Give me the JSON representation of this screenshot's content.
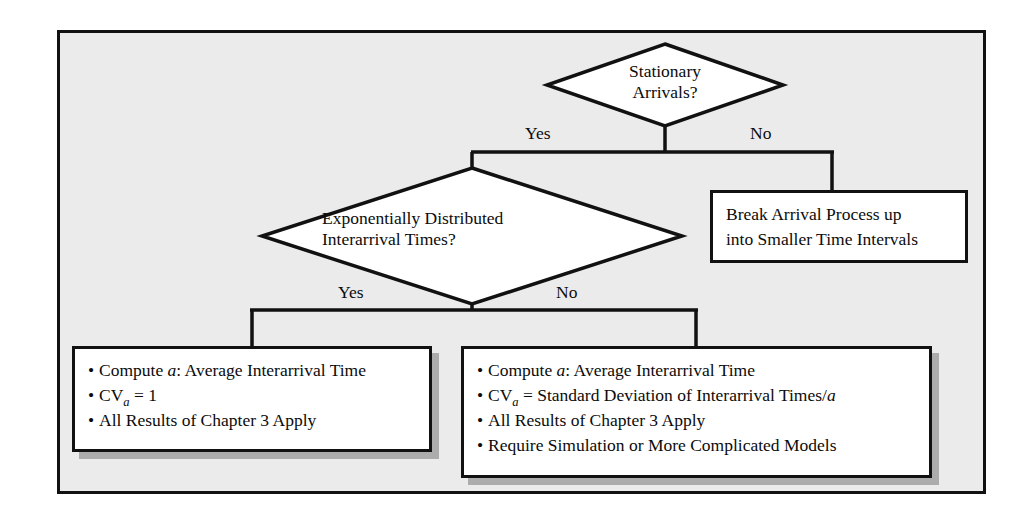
{
  "diagram": {
    "background_color": "#ebebeb",
    "frame_color": "#111111",
    "box_fill": "#ffffff",
    "text_color": "#0b0b0b"
  },
  "decisions": [
    {
      "id": "stationary-arrivals",
      "line1": "Stationary",
      "line2": "Arrivals?",
      "yes_label": "Yes",
      "no_label": "No"
    },
    {
      "id": "exponential-interarrival",
      "line1": "Exponentially Distributed",
      "line2": "Interarrival Times?",
      "yes_label": "Yes",
      "no_label": "No"
    }
  ],
  "process_box": {
    "id": "break-arrival-process",
    "line1": "Break Arrival Process up",
    "line2": "into Smaller Time Intervals"
  },
  "result_box_left": {
    "id": "exponential-results",
    "bullets": [
      {
        "bullet": "•",
        "pre": "Compute ",
        "ital": "a",
        "post": ": Average Interarrival Time"
      },
      {
        "bullet": "•",
        "pre": "CV",
        "sub": "a",
        "post": " = 1"
      },
      {
        "bullet": "•",
        "pre": "All Results of Chapter 3 Apply"
      }
    ]
  },
  "result_box_right": {
    "id": "general-results",
    "bullets": [
      {
        "bullet": "•",
        "pre": "Compute ",
        "ital": "a",
        "post": ": Average Interarrival Time"
      },
      {
        "bullet": "•",
        "pre": "CV",
        "sub": "a",
        "post": " = Standard Deviation of Interarrival Times/",
        "tail_ital": "a"
      },
      {
        "bullet": "•",
        "pre": "All Results of Chapter 3 Apply"
      },
      {
        "bullet": "•",
        "pre": "Require Simulation or More Complicated Models"
      }
    ]
  }
}
